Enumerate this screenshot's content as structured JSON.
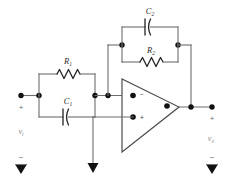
{
  "diagram": {
    "type": "schematic",
    "background_color": "#ffffff",
    "wire_color": "#6d6d6d",
    "component_color": "#222222",
    "node_color": "#111111",
    "label_color": "#2b2b2b",
    "terminal_label_color": "#8a8a8a"
  },
  "components": {
    "r1": {
      "label": "R",
      "subscript": "1",
      "kind": "resistor",
      "orientation": "horizontal",
      "position": "input-network-top"
    },
    "c1": {
      "label": "C",
      "subscript": "1",
      "kind": "capacitor",
      "orientation": "horizontal",
      "position": "input-network-bottom"
    },
    "c2": {
      "label": "C",
      "subscript": "2",
      "kind": "capacitor",
      "orientation": "horizontal",
      "position": "feedback-network-top"
    },
    "r2": {
      "label": "R",
      "subscript": "2",
      "kind": "resistor",
      "orientation": "horizontal",
      "position": "feedback-network-bottom"
    },
    "opamp": {
      "kind": "operational-amplifier",
      "inverting_pin": "−",
      "noninverting_pin": "+",
      "inverting_pin_position": "upper-left",
      "noninverting_pin_position": "lower-left",
      "output_position": "right-apex"
    }
  },
  "terminals": {
    "input": {
      "label": "v",
      "subscript": "i",
      "plus_sign": "+",
      "minus_sign": "−"
    },
    "output": {
      "label": "v",
      "subscript": "o",
      "plus_sign": "+",
      "minus_sign": "−"
    }
  },
  "grounds": [
    {
      "name": "input-ground",
      "symbol": "triangle"
    },
    {
      "name": "noninverting-input-ground",
      "symbol": "triangle"
    },
    {
      "name": "output-ground",
      "symbol": "triangle"
    }
  ]
}
